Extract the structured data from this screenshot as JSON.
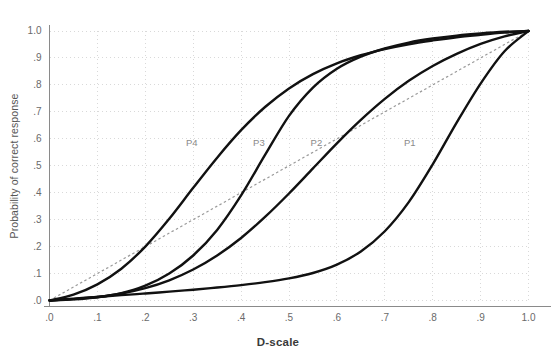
{
  "chart_data": {
    "type": "line",
    "title": "",
    "xlabel": "D-scale",
    "ylabel": "Probability of correct response",
    "xlim": [
      0,
      1
    ],
    "ylim": [
      0,
      1
    ],
    "grid": true,
    "legend_position": "inline-curve-labels",
    "x_ticks": [
      ".0",
      ".1",
      ".2",
      ".3",
      ".4",
      ".5",
      ".6",
      ".7",
      ".8",
      ".9",
      "1.0"
    ],
    "x_tick_values": [
      0,
      0.1,
      0.2,
      0.3,
      0.4,
      0.5,
      0.6,
      0.7,
      0.8,
      0.9,
      1.0
    ],
    "y_ticks": [
      ".0",
      ".1",
      ".2",
      ".3",
      ".4",
      ".5",
      ".6",
      ".7",
      ".8",
      ".9",
      "1.0"
    ],
    "y_tick_values": [
      0,
      0.1,
      0.2,
      0.3,
      0.4,
      0.5,
      0.6,
      0.7,
      0.8,
      0.9,
      1.0
    ],
    "reference_line": {
      "name": "identity-line",
      "style": "dashed",
      "x": [
        0,
        1
      ],
      "y": [
        0,
        1
      ]
    },
    "series": [
      {
        "name": "P1",
        "label": "P1",
        "label_x": 0.74,
        "label_y": 0.585,
        "x": [
          0.0,
          0.05,
          0.1,
          0.15,
          0.2,
          0.25,
          0.3,
          0.35,
          0.4,
          0.45,
          0.5,
          0.55,
          0.6,
          0.65,
          0.7,
          0.75,
          0.8,
          0.85,
          0.9,
          0.95,
          1.0
        ],
        "y": [
          0.0,
          0.007,
          0.013,
          0.02,
          0.026,
          0.033,
          0.04,
          0.048,
          0.057,
          0.068,
          0.082,
          0.102,
          0.133,
          0.182,
          0.257,
          0.365,
          0.505,
          0.66,
          0.805,
          0.925,
          1.0
        ]
      },
      {
        "name": "P2",
        "label": "P2",
        "label_x": 0.545,
        "label_y": 0.585,
        "x": [
          0.0,
          0.05,
          0.1,
          0.15,
          0.2,
          0.25,
          0.3,
          0.35,
          0.4,
          0.45,
          0.5,
          0.55,
          0.6,
          0.65,
          0.7,
          0.75,
          0.8,
          0.85,
          0.9,
          0.95,
          1.0
        ],
        "y": [
          0.0,
          0.005,
          0.013,
          0.026,
          0.046,
          0.075,
          0.115,
          0.167,
          0.232,
          0.31,
          0.397,
          0.49,
          0.583,
          0.67,
          0.748,
          0.815,
          0.87,
          0.915,
          0.952,
          0.98,
          1.0
        ]
      },
      {
        "name": "P3",
        "label": "P3",
        "label_x": 0.425,
        "label_y": 0.585,
        "x": [
          0.0,
          0.05,
          0.1,
          0.15,
          0.2,
          0.25,
          0.3,
          0.35,
          0.4,
          0.45,
          0.5,
          0.55,
          0.6,
          0.65,
          0.7,
          0.75,
          0.8,
          0.85,
          0.9,
          0.95,
          1.0
        ],
        "y": [
          0.0,
          0.004,
          0.012,
          0.027,
          0.055,
          0.1,
          0.167,
          0.262,
          0.39,
          0.54,
          0.685,
          0.79,
          0.86,
          0.905,
          0.935,
          0.957,
          0.972,
          0.983,
          0.991,
          0.997,
          1.0
        ]
      },
      {
        "name": "P4",
        "label": "P4",
        "label_x": 0.285,
        "label_y": 0.585,
        "x": [
          0.0,
          0.05,
          0.1,
          0.15,
          0.2,
          0.25,
          0.3,
          0.35,
          0.4,
          0.45,
          0.5,
          0.55,
          0.6,
          0.65,
          0.7,
          0.75,
          0.8,
          0.85,
          0.9,
          0.95,
          1.0
        ],
        "y": [
          0.0,
          0.022,
          0.06,
          0.118,
          0.2,
          0.303,
          0.418,
          0.53,
          0.632,
          0.718,
          0.787,
          0.84,
          0.88,
          0.91,
          0.933,
          0.951,
          0.965,
          0.977,
          0.986,
          0.994,
          1.0
        ]
      }
    ],
    "colors": {
      "curve": "#111111",
      "reference_line": "#9a9a9a",
      "grid": "#d9d9d9",
      "axis": "#8a8a8a",
      "tick_label": "#6a6a6a",
      "axis_title": "#3a3a3a",
      "curve_label": "#8a8a8a",
      "background": "#ffffff"
    }
  }
}
